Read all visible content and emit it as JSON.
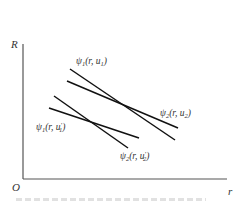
{
  "diagram": {
    "axes": {
      "y_label": "R",
      "x_label": "r",
      "origin_label": "O",
      "color": "#555555"
    },
    "line_color": "#111111",
    "curves": [
      {
        "id": "psi1-u1",
        "label_main": "ψ",
        "label_sub": "1",
        "label_args": "(r, u",
        "label_arg_sub": "1",
        "label_prime": "",
        "x1": 70,
        "y1": 69,
        "x2": 175,
        "y2": 140,
        "lx": 76,
        "ly": 64
      },
      {
        "id": "psi2-u2",
        "label_main": "ψ",
        "label_sub": "2",
        "label_args": "(r, u",
        "label_arg_sub": "2",
        "label_prime": "",
        "x1": 67,
        "y1": 81,
        "x2": 178,
        "y2": 128,
        "lx": 160,
        "ly": 116
      },
      {
        "id": "psi1-u1prime",
        "label_main": "ψ",
        "label_sub": "1",
        "label_args": "(r, u",
        "label_arg_sub": "1",
        "label_prime": "′",
        "x1": 49,
        "y1": 108,
        "x2": 139,
        "y2": 138,
        "lx": 36,
        "ly": 130
      },
      {
        "id": "psi2-u2prime",
        "label_main": "ψ",
        "label_sub": "2",
        "label_args": "(r, u",
        "label_arg_sub": "2",
        "label_prime": "′",
        "x1": 54,
        "y1": 96,
        "x2": 128,
        "y2": 148,
        "lx": 120,
        "ly": 159
      }
    ]
  }
}
